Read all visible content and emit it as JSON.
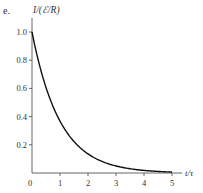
{
  "panel_label": "e.",
  "chart_data": {
    "type": "line",
    "title": "",
    "xlabel": "t/τ",
    "ylabel": "I/(ℰ/R)",
    "xlim": [
      0,
      5
    ],
    "ylim": [
      0,
      1.0
    ],
    "x_ticks": [
      "0",
      "1",
      "2",
      "3",
      "4",
      "5"
    ],
    "y_ticks": [
      "0.2",
      "0.4",
      "0.6",
      "0.8",
      "1.0"
    ],
    "grid": false,
    "legend": null,
    "series": [
      {
        "name": "I/(ℰ/R) = e^(−t/τ)",
        "x": [
          0,
          0.25,
          0.5,
          0.75,
          1,
          1.25,
          1.5,
          1.75,
          2,
          2.5,
          3,
          3.5,
          4,
          4.5,
          5
        ],
        "y": [
          1.0,
          0.78,
          0.61,
          0.47,
          0.37,
          0.29,
          0.22,
          0.17,
          0.14,
          0.08,
          0.05,
          0.03,
          0.02,
          0.01,
          0.007
        ]
      }
    ]
  },
  "style": {
    "line_color": "#111111",
    "axis_color": "#555555",
    "text_color": "#333333"
  }
}
